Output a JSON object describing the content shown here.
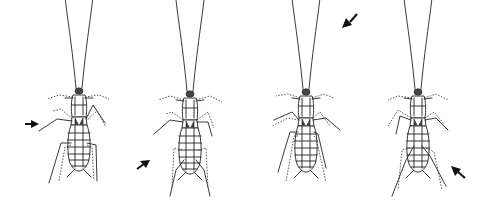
{
  "figure": {
    "panels": [
      {
        "id": 1,
        "arrow_direction": "right",
        "arrow_from": "left"
      },
      {
        "id": 2,
        "arrow_direction": "up-right",
        "arrow_from": "bottom-left"
      },
      {
        "id": 3,
        "arrow_direction": "down-left",
        "arrow_from": "top-right"
      },
      {
        "id": 4,
        "arrow_direction": "up-left",
        "arrow_from": "bottom-right"
      }
    ],
    "colors": {
      "line": "#222222",
      "background": "#ffffff"
    }
  }
}
